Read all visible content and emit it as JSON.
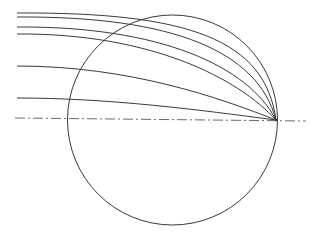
{
  "diagram": {
    "type": "streamlines-into-sink-on-circle",
    "width": 320,
    "height": 240,
    "background": "#ffffff",
    "stroke_color": "#3a3a3a",
    "axis_color": "#6a6a6a",
    "circle": {
      "cx": 172.5,
      "cy": 120,
      "r": 105
    },
    "axis": {
      "x1": 15,
      "y1": 118,
      "x2": 306,
      "y2": 121,
      "dash": "10 3 2 3"
    },
    "convergence_point": {
      "x": 276,
      "y": 120
    },
    "streamlines": [
      {
        "start_x": 17,
        "start_y": 13,
        "c1x": 190,
        "c1y": 12,
        "c2x": 265,
        "c2y": 40
      },
      {
        "start_x": 17,
        "start_y": 17,
        "c1x": 175,
        "c1y": 16,
        "c2x": 258,
        "c2y": 52
      },
      {
        "start_x": 17,
        "start_y": 27,
        "c1x": 160,
        "c1y": 26,
        "c2x": 248,
        "c2y": 66
      },
      {
        "start_x": 17,
        "start_y": 34,
        "c1x": 150,
        "c1y": 33,
        "c2x": 238,
        "c2y": 78
      },
      {
        "start_x": 17,
        "start_y": 66,
        "c1x": 130,
        "c1y": 66,
        "c2x": 220,
        "c2y": 98
      },
      {
        "start_x": 17,
        "start_y": 98,
        "c1x": 110,
        "c1y": 98,
        "c2x": 200,
        "c2y": 110
      }
    ]
  }
}
